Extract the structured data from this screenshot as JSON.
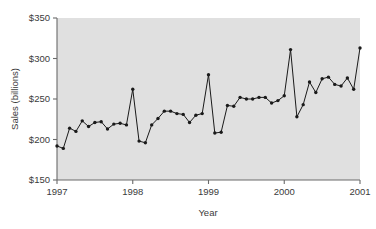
{
  "chart_data": {
    "type": "line",
    "title": "",
    "xlabel": "Year",
    "ylabel": "Sales (billions)",
    "xlim": [
      1997.0,
      2001.0
    ],
    "ylim": [
      150,
      350
    ],
    "yticks": [
      150,
      200,
      250,
      300,
      350
    ],
    "ytick_labels": [
      "$150",
      "$200",
      "$250",
      "$300",
      "$350"
    ],
    "xticks": [
      1997,
      1998,
      1999,
      2000,
      2001
    ],
    "xtick_labels": [
      "1997",
      "1998",
      "1999",
      "2000",
      "2001"
    ],
    "grid": false,
    "legend": "none",
    "marker": "filled-circle",
    "line_color": "#1a1a1a",
    "marker_color": "#1a1a1a",
    "plot_background": "#e0e0e0",
    "figure_background": "#ffffff",
    "x": [
      1997.0,
      1997.0833,
      1997.1667,
      1997.25,
      1997.3333,
      1997.4167,
      1997.5,
      1997.5833,
      1997.6667,
      1997.75,
      1997.8333,
      1997.9167,
      1998.0,
      1998.0833,
      1998.1667,
      1998.25,
      1998.3333,
      1998.4167,
      1998.5,
      1998.5833,
      1998.6667,
      1998.75,
      1998.8333,
      1998.9167,
      1999.0,
      1999.0833,
      1999.1667,
      1999.25,
      1999.3333,
      1999.4167,
      1999.5,
      1999.5833,
      1999.6667,
      1999.75,
      1999.8333,
      1999.9167,
      2000.0,
      2000.0833,
      2000.1667,
      2000.25,
      2000.3333,
      2000.4167,
      2000.5,
      2000.5833,
      2000.6667,
      2000.75,
      2000.8333,
      2000.9167,
      2001.0
    ],
    "values": [
      192,
      189,
      214,
      210,
      223,
      216,
      221,
      222,
      213,
      219,
      220,
      218,
      262,
      198,
      196,
      218,
      226,
      235,
      235,
      232,
      231,
      221,
      230,
      232,
      280,
      208,
      209,
      242,
      241,
      252,
      250,
      250,
      252,
      252,
      245,
      248,
      254,
      311,
      228,
      243,
      271,
      258,
      275,
      277,
      268,
      266,
      276,
      262,
      313
    ],
    "series_name": "Monthly retail sales"
  },
  "axis": {
    "y_title": "Sales (billions)",
    "x_title": "Year"
  }
}
